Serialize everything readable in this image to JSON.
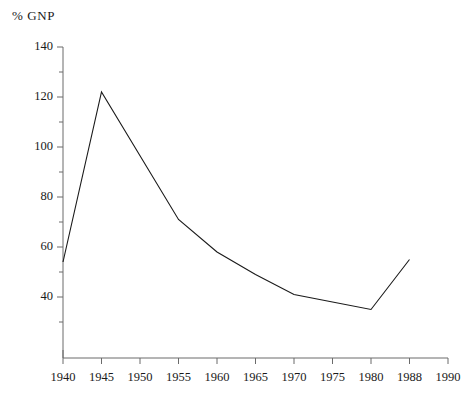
{
  "chart_data": {
    "type": "line",
    "title": "",
    "ylabel": "% GNP",
    "xlabel": "",
    "x": [
      1940,
      1945,
      1955,
      1960,
      1965,
      1970,
      1975,
      1980,
      1988
    ],
    "values": [
      54,
      122,
      71,
      58,
      49,
      41,
      38,
      35,
      55
    ],
    "series": [
      {
        "name": "% GNP",
        "values": [
          54,
          122,
          71,
          58,
          49,
          41,
          38,
          35,
          55
        ]
      }
    ],
    "xlim": [
      1940,
      1990
    ],
    "ylim": [
      30,
      145
    ],
    "ytick_labels": [
      "140",
      "120",
      "100",
      "80",
      "60",
      "40"
    ],
    "ytick_values": [
      140,
      120,
      100,
      80,
      60,
      40
    ],
    "yminor_values": [
      130,
      110,
      90,
      70,
      50,
      30
    ],
    "xtick_labels": [
      "1940",
      "1945",
      "1950",
      "1955",
      "1960",
      "1965",
      "1970",
      "1975",
      "1980",
      "1988",
      "1990"
    ],
    "xtick_values": [
      1940,
      1945,
      1950,
      1955,
      1960,
      1965,
      1970,
      1975,
      1980,
      1988,
      1990
    ],
    "grid": false,
    "legend": "none",
    "line_color": "#1a1a1a",
    "axis_color": "#6b6b6b",
    "background_color": "#ffffff"
  }
}
